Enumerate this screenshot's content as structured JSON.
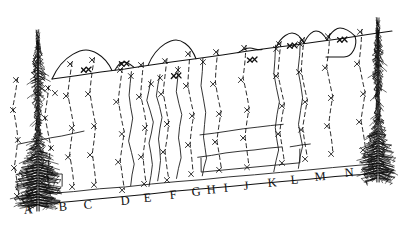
{
  "figure": {
    "kind": "hand-drawn-sketch",
    "title": "",
    "background_color": "#ffffff",
    "ink_color": "#111111",
    "description_of_scene": "forest stand cross-section with two conifer trees at the left and right ends, a slanted ground baseline, a slanted upper ridge line with rounded hill bumps, vertical solid and dashed boundary lines marked with x symbols"
  },
  "labels": {
    "baseline_letters": [
      {
        "text": "A",
        "x": 24,
        "y": 214
      },
      {
        "text": "B",
        "x": 59,
        "y": 211
      },
      {
        "text": "C",
        "x": 84,
        "y": 209
      },
      {
        "text": "D",
        "x": 121,
        "y": 205
      },
      {
        "text": "E",
        "x": 144,
        "y": 202
      },
      {
        "text": "F",
        "x": 170,
        "y": 199
      },
      {
        "text": "G",
        "x": 192,
        "y": 196
      },
      {
        "text": "H",
        "x": 207,
        "y": 194
      },
      {
        "text": "I",
        "x": 224,
        "y": 192
      },
      {
        "text": "J",
        "x": 244,
        "y": 190
      },
      {
        "text": "K",
        "x": 268,
        "y": 187
      },
      {
        "text": "L",
        "x": 291,
        "y": 184
      },
      {
        "text": "M",
        "x": 315,
        "y": 181
      },
      {
        "text": "N",
        "x": 345,
        "y": 177
      }
    ]
  },
  "geometry": {
    "ground_line": {
      "x1": 18,
      "y1": 206,
      "x2": 388,
      "y2": 172
    },
    "upper_ridge_line": {
      "x1": 52,
      "y1": 79,
      "x2": 392,
      "y2": 31
    },
    "hill_bumps": [
      {
        "name": "bump-1",
        "start_x": 52,
        "peak_x": 86,
        "peak_y": 50,
        "end_x": 112
      },
      {
        "name": "bump-2",
        "start_x": 115,
        "peak_x": 124,
        "peak_y": 62,
        "end_x": 134
      },
      {
        "name": "bump-3",
        "start_x": 148,
        "peak_x": 176,
        "peak_y": 40,
        "end_x": 196
      },
      {
        "name": "bump-4",
        "start_x": 238,
        "peak_x": 250,
        "peak_y": 48,
        "end_x": 262
      },
      {
        "name": "bump-5",
        "start_x": 276,
        "peak_x": 292,
        "peak_y": 33,
        "end_x": 304
      },
      {
        "name": "bump-6",
        "start_x": 304,
        "peak_x": 316,
        "peak_y": 31,
        "end_x": 327
      },
      {
        "name": "bump-7",
        "start_x": 327,
        "peak_x": 340,
        "peak_y": 28,
        "end_x": 355
      }
    ],
    "solid_boundary_lines": [
      {
        "name": "boundary-E",
        "points": "131,72 129,95 133,118 129,141 134,164 131,186"
      },
      {
        "name": "boundary-F",
        "points": "151,80 147,100 153,122 149,143 152,165 149,186"
      },
      {
        "name": "boundary-G",
        "points": "160,74 156,96 162,117 158,139 161,160 158,181"
      },
      {
        "name": "boundary-H",
        "points": "178,66 176,92 182,115 178,138 181,158 177,178"
      },
      {
        "name": "boundary-I",
        "points": "203,58 201,86 206,112 203,137 206,158 202,176"
      },
      {
        "name": "boundary-K",
        "points": "276,45 274,74 279,102 275,128 279,150 274,172"
      },
      {
        "name": "boundary-L",
        "points": "300,40 298,70 303,98 299,124 303,146 298,168"
      }
    ],
    "dashed_boundary_lines": [
      {
        "name": "dashed-A",
        "points": "18,78 13,108 18,138 14,166 19,196"
      },
      {
        "name": "dashed-B",
        "points": "49,86 45,116 51,146 47,174 51,200"
      },
      {
        "name": "dashed-C",
        "points": "72,62 68,94 74,126 70,155 74,185"
      },
      {
        "name": "dashed-D",
        "points": "94,58 90,92 96,124 92,153 96,183"
      },
      {
        "name": "dashed-E2",
        "points": "122,68 118,100 124,132 120,160 124,189"
      },
      {
        "name": "dashed-F2",
        "points": "143,63 141,95 147,126 143,155 146,183"
      },
      {
        "name": "dashed-G2",
        "points": "167,59 163,92 169,122 165,150 169,178"
      },
      {
        "name": "dashed-H2",
        "points": "190,52 188,84 194,114 190,143 193,172"
      },
      {
        "name": "dashed-I2",
        "points": "218,50 215,82 221,112 217,140 221,168"
      },
      {
        "name": "dashed-J2",
        "points": "246,46 243,78 249,108 245,136 249,165"
      },
      {
        "name": "dashed-K2",
        "points": "281,42 278,74 284,104 280,132 284,161"
      },
      {
        "name": "dashed-L2",
        "points": "304,38 301,70 307,100 303,128 307,157"
      },
      {
        "name": "dashed-M2",
        "points": "330,34 327,66 333,96 329,124 333,152"
      },
      {
        "name": "dashed-N2",
        "points": "362,30 359,62 365,92 361,120 365,148"
      }
    ],
    "interior_contours": [
      {
        "name": "contour-left",
        "points": "18,144 40,140 62,136 84,131"
      },
      {
        "name": "contour-mid-upper",
        "points": "200,135 228,131 258,127 283,124"
      },
      {
        "name": "contour-mid-lower",
        "points": "198,157 226,153 254,150 282,147"
      },
      {
        "name": "contour-right-short",
        "points": "290,147 302,145 310,144"
      }
    ],
    "box_outline": {
      "name": "lower-right-box",
      "points": "201,158 201,172 300,163 300,149"
    },
    "left_step": {
      "name": "left-step-shape",
      "points": "48,183 48,174 62,174 62,186"
    }
  },
  "x_marks": {
    "count": 78,
    "glyph": "x",
    "positions": [
      [
        16,
        80
      ],
      [
        13,
        110
      ],
      [
        18,
        140
      ],
      [
        14,
        168
      ],
      [
        17,
        196
      ],
      [
        48,
        88
      ],
      [
        45,
        118
      ],
      [
        51,
        148
      ],
      [
        47,
        176
      ],
      [
        70,
        64
      ],
      [
        66,
        96
      ],
      [
        72,
        128
      ],
      [
        68,
        157
      ],
      [
        72,
        187
      ],
      [
        92,
        60
      ],
      [
        88,
        94
      ],
      [
        94,
        126
      ],
      [
        90,
        155
      ],
      [
        94,
        185
      ],
      [
        120,
        70
      ],
      [
        116,
        102
      ],
      [
        122,
        134
      ],
      [
        118,
        162
      ],
      [
        122,
        190
      ],
      [
        141,
        65
      ],
      [
        139,
        97
      ],
      [
        145,
        128
      ],
      [
        141,
        157
      ],
      [
        144,
        184
      ],
      [
        165,
        61
      ],
      [
        161,
        94
      ],
      [
        167,
        124
      ],
      [
        163,
        152
      ],
      [
        167,
        180
      ],
      [
        188,
        54
      ],
      [
        186,
        86
      ],
      [
        192,
        116
      ],
      [
        188,
        145
      ],
      [
        191,
        174
      ],
      [
        216,
        52
      ],
      [
        213,
        84
      ],
      [
        219,
        114
      ],
      [
        215,
        142
      ],
      [
        219,
        170
      ],
      [
        244,
        48
      ],
      [
        241,
        80
      ],
      [
        247,
        110
      ],
      [
        243,
        138
      ],
      [
        247,
        167
      ],
      [
        279,
        44
      ],
      [
        276,
        76
      ],
      [
        282,
        106
      ],
      [
        278,
        134
      ],
      [
        282,
        163
      ],
      [
        302,
        40
      ],
      [
        299,
        72
      ],
      [
        305,
        102
      ],
      [
        301,
        130
      ],
      [
        305,
        159
      ],
      [
        328,
        36
      ],
      [
        325,
        68
      ],
      [
        331,
        98
      ],
      [
        327,
        126
      ],
      [
        331,
        154
      ],
      [
        360,
        32
      ],
      [
        357,
        64
      ],
      [
        363,
        94
      ],
      [
        359,
        122
      ],
      [
        363,
        150
      ],
      [
        131,
        76
      ],
      [
        151,
        84
      ],
      [
        160,
        78
      ],
      [
        178,
        70
      ],
      [
        203,
        62
      ],
      [
        276,
        49
      ],
      [
        300,
        44
      ],
      [
        55,
        93
      ]
    ],
    "bold_positions": [
      [
        176,
        76
      ],
      [
        252,
        60
      ],
      [
        292,
        46
      ],
      [
        342,
        40
      ],
      [
        124,
        64
      ],
      [
        86,
        70
      ]
    ]
  },
  "trees": [
    {
      "name": "conifer-tree-left",
      "trunk_x": 38,
      "top_y": 30,
      "base_y": 205,
      "half_width": 22
    },
    {
      "name": "conifer-tree-right",
      "trunk_x": 378,
      "top_y": 18,
      "base_y": 178,
      "half_width": 17
    }
  ]
}
